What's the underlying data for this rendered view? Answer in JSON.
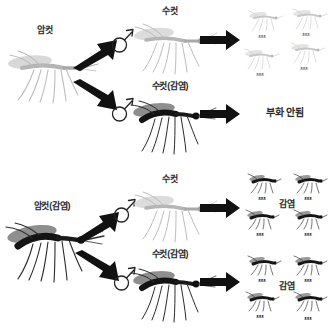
{
  "diagram": {
    "title_visible": false,
    "background_color": "#ffffff",
    "language": "ko"
  },
  "colors": {
    "uninfected_mosquito": "#b9b9b9",
    "infected_mosquito": "#1a1a1a",
    "infected_wing": "#8e8e8e",
    "arrow": "#111111",
    "text": "#2b2b2b"
  },
  "sections": [
    {
      "id": "cross-uninfected-female",
      "parent": {
        "label": "암컷",
        "state": "uninfected",
        "icon": "mosquito-icon"
      },
      "branches": [
        {
          "id": "uninfected-female-x-uninfected-male",
          "mate_label": "수컷",
          "mate_state": "uninfected",
          "sex_symbol": "♂",
          "sex_symbol_name": "male-symbol-icon",
          "branch_arrow": "thick-arrow-up-right-icon",
          "result_arrow": "block-arrow-right-icon",
          "outcome_label": "",
          "outcome_type": "offspring",
          "offspring_count": 4,
          "offspring_state": "uninfected"
        },
        {
          "id": "uninfected-female-x-infected-male",
          "mate_label": "수컷(감염)",
          "mate_state": "infected",
          "sex_symbol": "♂",
          "sex_symbol_name": "male-symbol-icon",
          "branch_arrow": "thick-arrow-down-right-icon",
          "result_arrow": "block-arrow-right-icon",
          "outcome_label": "부화 안됨",
          "outcome_type": "text",
          "offspring_count": 0,
          "offspring_state": "none"
        }
      ]
    },
    {
      "id": "cross-infected-female",
      "parent": {
        "label": "암컷(감염)",
        "state": "infected",
        "icon": "mosquito-icon"
      },
      "branches": [
        {
          "id": "infected-female-x-uninfected-male",
          "mate_label": "수컷",
          "mate_state": "uninfected",
          "sex_symbol": "♂",
          "sex_symbol_name": "male-symbol-icon",
          "branch_arrow": "thick-arrow-up-right-icon",
          "result_arrow": "block-arrow-right-icon",
          "outcome_label": "감염",
          "outcome_type": "offspring",
          "offspring_count": 4,
          "offspring_state": "infected"
        },
        {
          "id": "infected-female-x-infected-male",
          "mate_label": "수컷(감염)",
          "mate_state": "infected",
          "sex_symbol": "♂",
          "sex_symbol_name": "male-symbol-icon",
          "branch_arrow": "thick-arrow-down-right-icon",
          "result_arrow": "block-arrow-right-icon",
          "outcome_label": "감염",
          "outcome_type": "offspring",
          "offspring_count": 4,
          "offspring_state": "infected"
        }
      ]
    }
  ]
}
